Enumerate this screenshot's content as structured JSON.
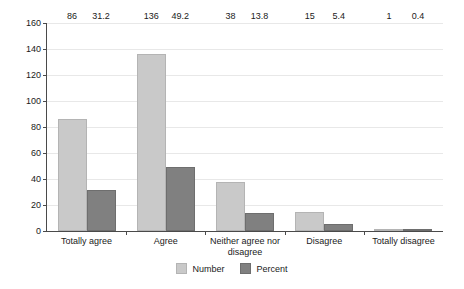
{
  "chart_data": {
    "type": "bar",
    "title": "",
    "subtitle": "",
    "xlabel": "",
    "ylabel": "",
    "ylim": [
      0,
      160
    ],
    "ytick_step": 20,
    "yticks": [
      "0",
      "20",
      "40",
      "60",
      "80",
      "100",
      "120",
      "140",
      "160"
    ],
    "grid": true,
    "legend_position": "bottom-center",
    "categories": [
      "Totally agree",
      "Agree",
      "Neither agree nor disagree",
      "Disagree",
      "Totally disagree"
    ],
    "series": [
      {
        "name": "Number",
        "color": "#c9c9c9",
        "values": [
          86,
          136,
          38,
          15,
          1
        ],
        "labels": [
          "86",
          "136",
          "38",
          "15",
          "1"
        ]
      },
      {
        "name": "Percent",
        "color": "#808080",
        "values": [
          31.2,
          49.2,
          13.8,
          5.4,
          0.4
        ],
        "labels": [
          "31.2",
          "49.2",
          "13.8",
          "5.4",
          "0.4"
        ]
      }
    ]
  },
  "legend": {
    "items": [
      {
        "label": "Number"
      },
      {
        "label": "Percent"
      }
    ]
  },
  "colors": {
    "series_number": "#c9c9c9",
    "series_percent": "#808080",
    "axis": "#4a4a4a",
    "gridline": "#e8e8e8",
    "text": "#1a1a1a",
    "background": "#ffffff"
  }
}
